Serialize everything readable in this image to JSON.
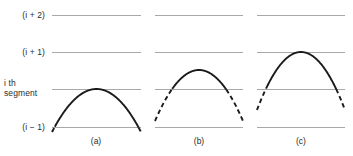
{
  "figure": {
    "title": "",
    "background_color": "#ffffff",
    "grid_line_color": "#a8a8a8",
    "curve_color": "#1a1a1a",
    "text_color": "#2b2b2b",
    "width": 353,
    "height": 156
  },
  "axis_labels": [
    {
      "id": "level-i-plus-2",
      "text": "(i + 2)",
      "y": 15
    },
    {
      "id": "level-i-plus-1",
      "text": "(i + 1)",
      "y": 52
    },
    {
      "id": "level-i-th-line1",
      "text": "i th",
      "y": 84
    },
    {
      "id": "level-i-th-line2",
      "text": "segment",
      "y": 94
    },
    {
      "id": "level-i-minus-1",
      "text": "(i − 1)",
      "y": 127
    }
  ],
  "grid_levels": [
    {
      "name": "i-plus-2",
      "y": 15
    },
    {
      "name": "i-plus-1",
      "y": 52
    },
    {
      "name": "i-th",
      "y": 89
    },
    {
      "name": "i-minus-1",
      "y": 127
    }
  ],
  "panels": [
    {
      "caption": "(a)",
      "x_start": 52,
      "x_end": 141,
      "caption_x": 96,
      "peak_level": "i-th",
      "peak_y": 89,
      "base_y": 132,
      "solid_from_y": 89,
      "solid_to_y": 127,
      "description": "parabola peak just touches the i th segment line"
    },
    {
      "caption": "(b)",
      "x_start": 155,
      "x_end": 243,
      "caption_x": 199,
      "peak_level": "between-i-th-and-i-plus-1",
      "peak_y": 70,
      "base_y": 121,
      "solid_from_y": 70,
      "solid_to_y": 89,
      "description": "parabola peak overshoots past the i th segment line"
    },
    {
      "caption": "(c)",
      "x_start": 257,
      "x_end": 345,
      "caption_x": 301,
      "peak_level": "i-plus-1",
      "peak_y": 52,
      "base_y": 110,
      "solid_from_y": 52,
      "solid_to_y": 89,
      "description": "parabola peak reaches the (i + 1) line"
    }
  ],
  "panel_captions": [
    "(a)",
    "(b)",
    "(c)"
  ],
  "caption_y": 136,
  "chart_data": {
    "type": "line",
    "title": "",
    "xlabel": "",
    "ylabel": "",
    "grid": true,
    "legend": null,
    "y_tick_labels": [
      "(i + 2)",
      "(i + 1)",
      "i th segment",
      "(i − 1)"
    ],
    "y_tick_pixels": [
      15,
      52,
      89,
      127
    ],
    "series": [
      {
        "name": "(a)",
        "shape": "parabola",
        "peak_level": "i th segment",
        "solid_band": "i th segment"
      },
      {
        "name": "(b)",
        "shape": "parabola",
        "peak_level": "above i th segment",
        "solid_band": "above i th segment"
      },
      {
        "name": "(c)",
        "shape": "parabola",
        "peak_level": "(i + 1)",
        "solid_band": "between i th segment and (i + 1)"
      }
    ]
  }
}
